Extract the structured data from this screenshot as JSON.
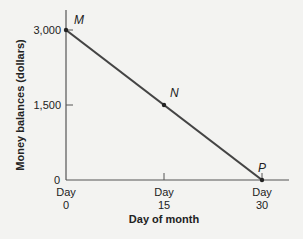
{
  "chart_data": {
    "type": "line",
    "title": "",
    "xlabel": "Day of month",
    "ylabel": "Money balances (dollars)",
    "x": [
      0,
      15,
      30
    ],
    "series": [
      {
        "name": "Money balances",
        "values": [
          3000,
          1500,
          0
        ]
      }
    ],
    "xlim": [
      0,
      30
    ],
    "ylim": [
      0,
      3000
    ],
    "grid": false,
    "legend": "none",
    "x_ticks": [
      {
        "value": 0,
        "line1": "Day",
        "line2": "0"
      },
      {
        "value": 15,
        "line1": "Day",
        "line2": "15"
      },
      {
        "value": 30,
        "line1": "Day",
        "line2": "30"
      }
    ],
    "y_ticks": [
      {
        "value": 0,
        "label": "0"
      },
      {
        "value": 1500,
        "label": "1,500"
      },
      {
        "value": 3000,
        "label": "3,000"
      }
    ],
    "annotations": [
      {
        "label": "M",
        "x": 0,
        "y": 3000
      },
      {
        "label": "N",
        "x": 15,
        "y": 1500
      },
      {
        "label": "P",
        "x": 30,
        "y": 0
      }
    ]
  },
  "colors": {
    "line": "#444444",
    "axis": "#555555",
    "background": "#f3f3f1"
  }
}
